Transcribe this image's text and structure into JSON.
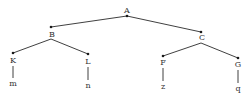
{
  "diagram": {
    "type": "tree",
    "colors": {
      "edge": "#2a2a2a",
      "node_dot": "#1a1a1a",
      "label": "#333333",
      "background": "#ffffff"
    },
    "nodes": [
      {
        "id": "A",
        "label": "A",
        "dot": [
          127,
          16
        ],
        "label_pos": [
          127,
          7
        ]
      },
      {
        "id": "B",
        "label": "B",
        "dot": [
          51,
          27
        ],
        "label_pos": [
          52,
          31
        ]
      },
      {
        "id": "C",
        "label": "C",
        "dot": [
          201,
          32
        ],
        "label_pos": [
          202,
          34
        ]
      },
      {
        "id": "K",
        "label": "K",
        "dot": [
          13,
          53
        ],
        "label_pos": [
          13,
          57
        ]
      },
      {
        "id": "L",
        "label": "L",
        "dot": [
          88,
          54
        ],
        "label_pos": [
          88,
          58
        ]
      },
      {
        "id": "F",
        "label": "F",
        "dot": [
          163,
          56
        ],
        "label_pos": [
          163,
          59
        ]
      },
      {
        "id": "G",
        "label": "G",
        "dot": [
          238,
          58
        ],
        "label_pos": [
          238,
          61
        ]
      },
      {
        "id": "m",
        "label": "m",
        "label_pos": [
          13,
          80
        ]
      },
      {
        "id": "n",
        "label": "n",
        "label_pos": [
          88,
          82
        ]
      },
      {
        "id": "z",
        "label": "z",
        "label_pos": [
          163,
          83
        ]
      },
      {
        "id": "q",
        "label": "q",
        "label_pos": [
          238,
          85
        ]
      }
    ],
    "edges": [
      {
        "from": "A",
        "to": "B",
        "x1": 127,
        "y1": 16,
        "x2": 51,
        "y2": 27
      },
      {
        "from": "A",
        "to": "C",
        "x1": 127,
        "y1": 16,
        "x2": 201,
        "y2": 32
      },
      {
        "from": "B",
        "to": "K",
        "x1": 51,
        "y1": 39,
        "x2": 13,
        "y2": 53
      },
      {
        "from": "B",
        "to": "L",
        "x1": 51,
        "y1": 39,
        "x2": 88,
        "y2": 54
      },
      {
        "from": "C",
        "to": "F",
        "x1": 201,
        "y1": 43,
        "x2": 163,
        "y2": 56
      },
      {
        "from": "C",
        "to": "G",
        "x1": 201,
        "y1": 43,
        "x2": 238,
        "y2": 58
      },
      {
        "from": "K",
        "to": "m",
        "x1": 13,
        "y1": 66,
        "x2": 13,
        "y2": 78
      },
      {
        "from": "L",
        "to": "n",
        "x1": 88,
        "y1": 67,
        "x2": 88,
        "y2": 80
      },
      {
        "from": "F",
        "to": "z",
        "x1": 163,
        "y1": 68,
        "x2": 163,
        "y2": 81
      },
      {
        "from": "G",
        "to": "q",
        "x1": 238,
        "y1": 70,
        "x2": 238,
        "y2": 83
      }
    ]
  }
}
